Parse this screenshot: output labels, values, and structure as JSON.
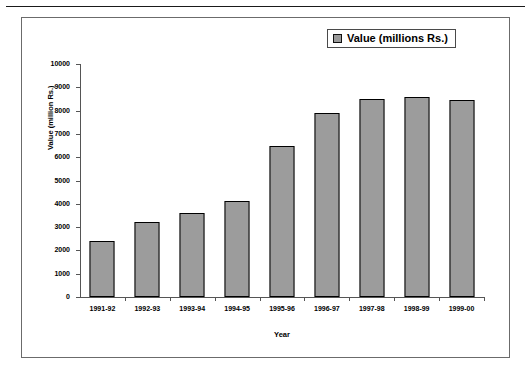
{
  "chart_data": {
    "type": "bar",
    "title": "",
    "xlabel": "Year",
    "ylabel": "Value (million Rs.)",
    "categories": [
      "1991-92",
      "1992-93",
      "1993-94",
      "1994-95",
      "1995-96",
      "1996-97",
      "1997-98",
      "1998-99",
      "1999-00"
    ],
    "values": [
      2400,
      3200,
      3600,
      4100,
      6500,
      7900,
      8500,
      8600,
      8450
    ],
    "series": [
      {
        "name": "Value (millions Rs.)",
        "values": [
          2400,
          3200,
          3600,
          4100,
          6500,
          7900,
          8500,
          8600,
          8450
        ]
      }
    ],
    "ylim": [
      0,
      10000
    ],
    "ytick_step": 1000,
    "yticks": [
      0,
      1000,
      2000,
      3000,
      4000,
      5000,
      6000,
      7000,
      8000,
      9000,
      10000
    ],
    "ytick_labels": [
      "0",
      "1000",
      "2000",
      "3000",
      "4000",
      "5000",
      "6000",
      "7000",
      "8000",
      "9000",
      "10000"
    ],
    "grid": false,
    "legend": {
      "position": "top-right",
      "entries": [
        {
          "label": "Value (millions Rs.)",
          "swatch_name": "legend-swatch-value",
          "color": "#9a9a9a"
        }
      ]
    },
    "colors": {
      "bar_fill": "#9c9c9c",
      "bar_outline": "#000000",
      "axis": "#555555",
      "frame": "#6b6b6b",
      "text": "#000000"
    }
  }
}
